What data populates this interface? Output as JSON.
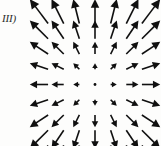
{
  "figure": {
    "label": "III)",
    "caption": "",
    "background_color": "#fdfdfc",
    "ink_color": "#101010"
  },
  "chart_data": {
    "type": "scatter",
    "plot_kind": "vector-field-quiver",
    "title": "III)",
    "subtitle": "",
    "xlabel": "",
    "ylabel": "",
    "grid": false,
    "legend": null,
    "axes_visible": false,
    "tick_labels": [],
    "field_formula": "F(x,y) = (x, y)",
    "grid_columns": 7,
    "grid_rows": 9,
    "grid_x": [
      -3,
      -2,
      -1,
      0,
      1,
      2,
      3
    ],
    "grid_y": [
      4,
      3,
      2,
      1,
      0,
      -1,
      -2,
      -3,
      -4
    ],
    "origin_px": [
      95,
      84.5
    ],
    "cell_spacing_px": [
      18.2,
      17.8
    ],
    "magnitude_scale_px": 6.1,
    "xlim": [
      -3.5,
      3.5
    ],
    "ylim": [
      -4.5,
      4.5
    ],
    "vectors": [
      {
        "x": -3,
        "y": 4,
        "u": -3,
        "v": 4,
        "magnitude": 5.0,
        "angle_deg": 126.9
      },
      {
        "x": -2,
        "y": 4,
        "u": -2,
        "v": 4,
        "magnitude": 4.47,
        "angle_deg": 116.6
      },
      {
        "x": -1,
        "y": 4,
        "u": -1,
        "v": 4,
        "magnitude": 4.12,
        "angle_deg": 104.0
      },
      {
        "x": 0,
        "y": 4,
        "u": 0,
        "v": 4,
        "magnitude": 4.0,
        "angle_deg": 90.0
      },
      {
        "x": 1,
        "y": 4,
        "u": 1,
        "v": 4,
        "magnitude": 4.12,
        "angle_deg": 76.0
      },
      {
        "x": 2,
        "y": 4,
        "u": 2,
        "v": 4,
        "magnitude": 4.47,
        "angle_deg": 63.4
      },
      {
        "x": 3,
        "y": 4,
        "u": 3,
        "v": 4,
        "magnitude": 5.0,
        "angle_deg": 53.1
      },
      {
        "x": -3,
        "y": 3,
        "u": -3,
        "v": 3,
        "magnitude": 4.24,
        "angle_deg": 135.0
      },
      {
        "x": -2,
        "y": 3,
        "u": -2,
        "v": 3,
        "magnitude": 3.61,
        "angle_deg": 123.7
      },
      {
        "x": -1,
        "y": 3,
        "u": -1,
        "v": 3,
        "magnitude": 3.16,
        "angle_deg": 108.4
      },
      {
        "x": 0,
        "y": 3,
        "u": 0,
        "v": 3,
        "magnitude": 3.0,
        "angle_deg": 90.0
      },
      {
        "x": 1,
        "y": 3,
        "u": 1,
        "v": 3,
        "magnitude": 3.16,
        "angle_deg": 71.6
      },
      {
        "x": 2,
        "y": 3,
        "u": 2,
        "v": 3,
        "magnitude": 3.61,
        "angle_deg": 56.3
      },
      {
        "x": 3,
        "y": 3,
        "u": 3,
        "v": 3,
        "magnitude": 4.24,
        "angle_deg": 45.0
      },
      {
        "x": -3,
        "y": 2,
        "u": -3,
        "v": 2,
        "magnitude": 3.61,
        "angle_deg": 146.3
      },
      {
        "x": -2,
        "y": 2,
        "u": -2,
        "v": 2,
        "magnitude": 2.83,
        "angle_deg": 135.0
      },
      {
        "x": -1,
        "y": 2,
        "u": -1,
        "v": 2,
        "magnitude": 2.24,
        "angle_deg": 116.6
      },
      {
        "x": 0,
        "y": 2,
        "u": 0,
        "v": 2,
        "magnitude": 2.0,
        "angle_deg": 90.0
      },
      {
        "x": 1,
        "y": 2,
        "u": 1,
        "v": 2,
        "magnitude": 2.24,
        "angle_deg": 63.4
      },
      {
        "x": 2,
        "y": 2,
        "u": 2,
        "v": 2,
        "magnitude": 2.83,
        "angle_deg": 45.0
      },
      {
        "x": 3,
        "y": 2,
        "u": 3,
        "v": 2,
        "magnitude": 3.61,
        "angle_deg": 33.7
      },
      {
        "x": -3,
        "y": 1,
        "u": -3,
        "v": 1,
        "magnitude": 3.16,
        "angle_deg": 161.6
      },
      {
        "x": -2,
        "y": 1,
        "u": -2,
        "v": 1,
        "magnitude": 2.24,
        "angle_deg": 153.4
      },
      {
        "x": -1,
        "y": 1,
        "u": -1,
        "v": 1,
        "magnitude": 1.41,
        "angle_deg": 135.0
      },
      {
        "x": 0,
        "y": 1,
        "u": 0,
        "v": 1,
        "magnitude": 1.0,
        "angle_deg": 90.0
      },
      {
        "x": 1,
        "y": 1,
        "u": 1,
        "v": 1,
        "magnitude": 1.41,
        "angle_deg": 45.0
      },
      {
        "x": 2,
        "y": 1,
        "u": 2,
        "v": 1,
        "magnitude": 2.24,
        "angle_deg": 26.6
      },
      {
        "x": 3,
        "y": 1,
        "u": 3,
        "v": 1,
        "magnitude": 3.16,
        "angle_deg": 18.4
      },
      {
        "x": -3,
        "y": 0,
        "u": -3,
        "v": 0,
        "magnitude": 3.0,
        "angle_deg": 180.0
      },
      {
        "x": -2,
        "y": 0,
        "u": -2,
        "v": 0,
        "magnitude": 2.0,
        "angle_deg": 180.0
      },
      {
        "x": -1,
        "y": 0,
        "u": -1,
        "v": 0,
        "magnitude": 1.0,
        "angle_deg": 180.0
      },
      {
        "x": 0,
        "y": 0,
        "u": 0,
        "v": 0,
        "magnitude": 0.0,
        "angle_deg": null
      },
      {
        "x": 1,
        "y": 0,
        "u": 1,
        "v": 0,
        "magnitude": 1.0,
        "angle_deg": 0.0
      },
      {
        "x": 2,
        "y": 0,
        "u": 2,
        "v": 0,
        "magnitude": 2.0,
        "angle_deg": 0.0
      },
      {
        "x": 3,
        "y": 0,
        "u": 3,
        "v": 0,
        "magnitude": 3.0,
        "angle_deg": 0.0
      },
      {
        "x": -3,
        "y": -1,
        "u": -3,
        "v": -1,
        "magnitude": 3.16,
        "angle_deg": -161.6
      },
      {
        "x": -2,
        "y": -1,
        "u": -2,
        "v": -1,
        "magnitude": 2.24,
        "angle_deg": -153.4
      },
      {
        "x": -1,
        "y": -1,
        "u": -1,
        "v": -1,
        "magnitude": 1.41,
        "angle_deg": -135.0
      },
      {
        "x": 0,
        "y": -1,
        "u": 0,
        "v": -1,
        "magnitude": 1.0,
        "angle_deg": -90.0
      },
      {
        "x": 1,
        "y": -1,
        "u": 1,
        "v": -1,
        "magnitude": 1.41,
        "angle_deg": -45.0
      },
      {
        "x": 2,
        "y": -1,
        "u": 2,
        "v": -1,
        "magnitude": 2.24,
        "angle_deg": -26.6
      },
      {
        "x": 3,
        "y": -1,
        "u": 3,
        "v": -1,
        "magnitude": 3.16,
        "angle_deg": -18.4
      },
      {
        "x": -3,
        "y": -2,
        "u": -3,
        "v": -2,
        "magnitude": 3.61,
        "angle_deg": -146.3
      },
      {
        "x": -2,
        "y": -2,
        "u": -2,
        "v": -2,
        "magnitude": 2.83,
        "angle_deg": -135.0
      },
      {
        "x": -1,
        "y": -2,
        "u": -1,
        "v": -2,
        "magnitude": 2.24,
        "angle_deg": -116.6
      },
      {
        "x": 0,
        "y": -2,
        "u": 0,
        "v": -2,
        "magnitude": 2.0,
        "angle_deg": -90.0
      },
      {
        "x": 1,
        "y": -2,
        "u": 1,
        "v": -2,
        "magnitude": 2.24,
        "angle_deg": -63.4
      },
      {
        "x": 2,
        "y": -2,
        "u": 2,
        "v": -2,
        "magnitude": 2.83,
        "angle_deg": -45.0
      },
      {
        "x": 3,
        "y": -2,
        "u": 3,
        "v": -2,
        "magnitude": 3.61,
        "angle_deg": -33.7
      },
      {
        "x": -3,
        "y": -3,
        "u": -3,
        "v": -3,
        "magnitude": 4.24,
        "angle_deg": -135.0
      },
      {
        "x": -2,
        "y": -3,
        "u": -2,
        "v": -3,
        "magnitude": 3.61,
        "angle_deg": -123.7
      },
      {
        "x": -1,
        "y": -3,
        "u": -1,
        "v": -3,
        "magnitude": 3.16,
        "angle_deg": -108.4
      },
      {
        "x": 0,
        "y": -3,
        "u": 0,
        "v": -3,
        "magnitude": 3.0,
        "angle_deg": -90.0
      },
      {
        "x": 1,
        "y": -3,
        "u": 1,
        "v": -3,
        "magnitude": 3.16,
        "angle_deg": -71.6
      },
      {
        "x": 2,
        "y": -3,
        "u": 2,
        "v": -3,
        "magnitude": 3.61,
        "angle_deg": -56.3
      },
      {
        "x": 3,
        "y": -3,
        "u": 3,
        "v": -3,
        "magnitude": 4.24,
        "angle_deg": -45.0
      },
      {
        "x": -3,
        "y": -4,
        "u": -3,
        "v": -4,
        "magnitude": 5.0,
        "angle_deg": -126.9
      },
      {
        "x": -2,
        "y": -4,
        "u": -2,
        "v": -4,
        "magnitude": 4.47,
        "angle_deg": -116.6
      },
      {
        "x": -1,
        "y": -4,
        "u": -1,
        "v": -4,
        "magnitude": 4.12,
        "angle_deg": -104.0
      },
      {
        "x": 0,
        "y": -4,
        "u": 0,
        "v": -4,
        "magnitude": 4.0,
        "angle_deg": -90.0
      },
      {
        "x": 1,
        "y": -4,
        "u": 1,
        "v": -4,
        "magnitude": 4.12,
        "angle_deg": -76.0
      },
      {
        "x": 2,
        "y": -4,
        "u": 2,
        "v": -4,
        "magnitude": 4.47,
        "angle_deg": -63.4
      },
      {
        "x": 3,
        "y": -4,
        "u": 3,
        "v": -4,
        "magnitude": 5.0,
        "angle_deg": -53.1
      }
    ]
  }
}
